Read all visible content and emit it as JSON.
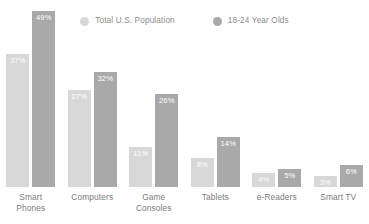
{
  "chart_data": {
    "type": "bar",
    "title": "",
    "subtitle": "",
    "xlabel": "",
    "ylabel": "",
    "ylim": [
      0,
      52
    ],
    "grid": false,
    "legend_position": "top-center",
    "value_label_suffix": "%",
    "categories": [
      "Smart\nPhones",
      "Computers",
      "Game\nConsoles",
      "Tablets",
      "e-Readers",
      "Smart TV"
    ],
    "series": [
      {
        "name": "Total U.S. Population",
        "color": "#d8d8d8",
        "values": [
          37,
          27,
          11,
          8,
          4,
          3
        ],
        "labels": [
          "37%",
          "27%",
          "11%",
          "8%",
          "4%",
          "3%"
        ]
      },
      {
        "name": "18-24 Year Olds",
        "color": "#a9a9a9",
        "values": [
          49,
          32,
          26,
          14,
          5,
          6
        ],
        "labels": [
          "49%",
          "32%",
          "26%",
          "14%",
          "5%",
          "6%"
        ]
      }
    ]
  },
  "legend": {
    "items": [
      {
        "label": "Total U.S. Population",
        "color": "#d8d8d8",
        "marker": "circle-dot-icon"
      },
      {
        "label": "18-24 Year Olds",
        "color": "#a9a9a9",
        "marker": "circle-dot-icon"
      }
    ]
  },
  "colors": {
    "background": "#ffffff",
    "series_total_population": "#d8d8d8",
    "series_young_adults": "#a9a9a9",
    "axis_label_text": "#7d7d7d",
    "legend_text": "#8c8c8c",
    "value_label_text": "#ffffff"
  }
}
